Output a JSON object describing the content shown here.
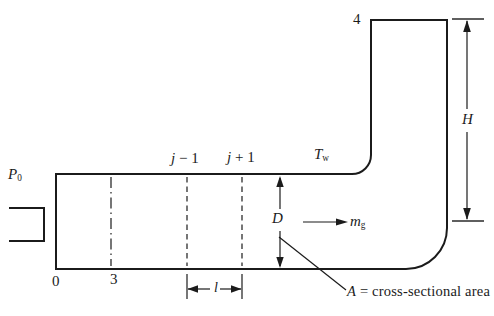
{
  "diagram": {
    "background": "#ffffff",
    "line_color": "#1b1b1b",
    "labels": {
      "inlet_pressure": {
        "base": "P",
        "sub": "0"
      },
      "station_0": "0",
      "station_3": "3",
      "station_j_minus": {
        "var": "j",
        "rest": " − 1"
      },
      "station_j_plus": {
        "var": "j",
        "rest": " + 1"
      },
      "wall_temperature": {
        "base": "T",
        "sub": "w"
      },
      "station_4": "4",
      "stack_height": "H",
      "duct_diameter": "D",
      "gas_flow": {
        "base": "m",
        "sub": "g"
      },
      "segment_length": "l",
      "area_note": {
        "var": "A",
        "rest": " = cross-sectional area"
      }
    }
  }
}
